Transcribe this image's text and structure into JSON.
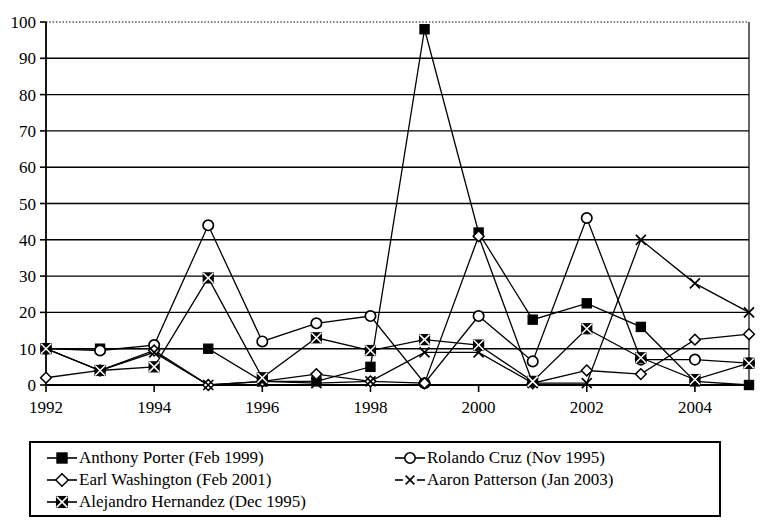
{
  "chart_data": {
    "type": "line",
    "title": "",
    "subtitle": "",
    "xlabel": "",
    "ylabel": "",
    "xlim": [
      1992,
      2005
    ],
    "ylim": [
      0,
      100
    ],
    "grid": "horizontal",
    "legend_position": "bottom",
    "x": [
      1992,
      1993,
      1994,
      1995,
      1996,
      1997,
      1998,
      1999,
      2000,
      2001,
      2002,
      2003,
      2004,
      2005
    ],
    "xticks": [
      "1992",
      "1994",
      "1996",
      "1998",
      "2000",
      "2002",
      "2004"
    ],
    "xtick_values": [
      1992,
      1994,
      1996,
      1998,
      2000,
      2002,
      2004
    ],
    "yticks": [
      "0",
      "10",
      "20",
      "30",
      "40",
      "50",
      "60",
      "70",
      "80",
      "90",
      "100"
    ],
    "ytick_values": [
      0,
      10,
      20,
      30,
      40,
      50,
      60,
      70,
      80,
      90,
      100
    ],
    "series": [
      {
        "name": "Anthony Porter (Feb 1999)",
        "marker": "filled-square",
        "values": [
          10,
          10,
          10,
          10,
          1,
          1,
          5,
          98,
          42,
          18,
          22.5,
          16,
          1,
          0
        ]
      },
      {
        "name": "Rolando Cruz (Nov 1995)",
        "marker": "open-circle",
        "values": [
          10,
          9.5,
          11,
          44,
          12,
          17,
          19,
          0.5,
          19,
          6.5,
          46,
          7,
          7,
          6
        ]
      },
      {
        "name": "Earl Washington (Feb 2001)",
        "marker": "open-diamond",
        "values": [
          2,
          4,
          9.5,
          0,
          1,
          3,
          1,
          0.5,
          41,
          0.5,
          4,
          3,
          12.5,
          14
        ]
      },
      {
        "name": "Aaron Patterson (Jan 2003)",
        "marker": "x-cross",
        "values": [
          10,
          4,
          9,
          0,
          1,
          0.5,
          1,
          9,
          9,
          0.5,
          0.5,
          40,
          28,
          20
        ]
      },
      {
        "name": "Alejandro Hernandez (Dec 1995)",
        "marker": "crossed-square",
        "values": [
          10,
          4,
          5,
          29.5,
          2,
          13,
          9.5,
          12.5,
          11,
          1,
          15.5,
          7.5,
          1.5,
          6
        ]
      }
    ]
  },
  "figure": {
    "top_border_style": "dotted",
    "frame_color": "#000000",
    "gridline_color": "#000000",
    "background": "#ffffff"
  },
  "legend": {
    "rows": [
      [
        "Anthony Porter (Feb 1999)",
        "Rolando Cruz (Nov 1995)"
      ],
      [
        "Earl Washington (Feb 2001)",
        "Aaron Patterson (Jan 2003)"
      ],
      [
        "Alejandro Hernandez (Dec 1995)"
      ]
    ]
  }
}
